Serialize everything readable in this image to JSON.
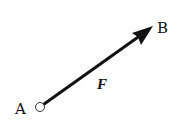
{
  "diagram": {
    "type": "force-vector",
    "points": {
      "A": {
        "label": "A",
        "x": 40,
        "y": 107
      },
      "B": {
        "label": "B",
        "x": 153,
        "y": 27
      }
    },
    "vector": {
      "label": "F",
      "from": "A",
      "to": "B"
    },
    "colors": {
      "stroke": "#111111",
      "background": "#ffffff"
    }
  }
}
